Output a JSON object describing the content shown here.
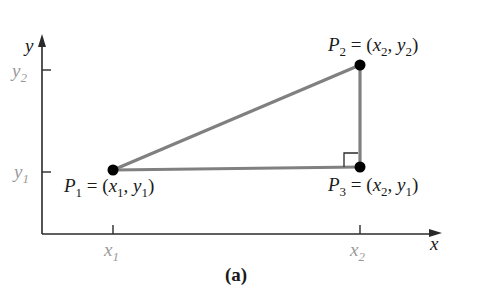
{
  "figure": {
    "caption": "(a)",
    "colors": {
      "axis": "#2a2a2a",
      "segment": "#808080",
      "point": "#000000",
      "label": "#1a1a1a",
      "tick_label": "#9a9a9a"
    },
    "axes": {
      "x_label": "x",
      "y_label": "y",
      "x_ticks": [
        {
          "name": "x",
          "sub": "1"
        },
        {
          "name": "x",
          "sub": "2"
        }
      ],
      "y_ticks": [
        {
          "name": "y",
          "sub": "2"
        },
        {
          "name": "y",
          "sub": "1"
        }
      ]
    },
    "points": [
      {
        "id": "P1",
        "name": "P",
        "sub": "1",
        "eq": " = (",
        "coord_x": "x",
        "coord_x_sub": "1",
        "sep": ", ",
        "coord_y": "y",
        "coord_y_sub": "1",
        "close": ")"
      },
      {
        "id": "P2",
        "name": "P",
        "sub": "2",
        "eq": " = (",
        "coord_x": "x",
        "coord_x_sub": "2",
        "sep": ", ",
        "coord_y": "y",
        "coord_y_sub": "2",
        "close": ")"
      },
      {
        "id": "P3",
        "name": "P",
        "sub": "3",
        "eq": " = (",
        "coord_x": "x",
        "coord_x_sub": "2",
        "sep": ", ",
        "coord_y": "y",
        "coord_y_sub": "1",
        "close": ")"
      }
    ],
    "right_angle_marker": "at P3"
  }
}
